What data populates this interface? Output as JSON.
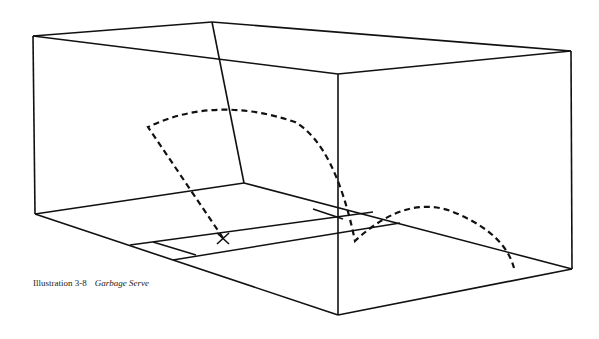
{
  "caption": {
    "label": "Illustration 3-8",
    "title": "Garbage Serve"
  },
  "colors": {
    "line": "#111111",
    "background": "#ffffff"
  },
  "diagram": {
    "elements": [
      "court-walls",
      "floor-service-zone",
      "server-position-x",
      "serve-trajectory-dashed"
    ]
  }
}
